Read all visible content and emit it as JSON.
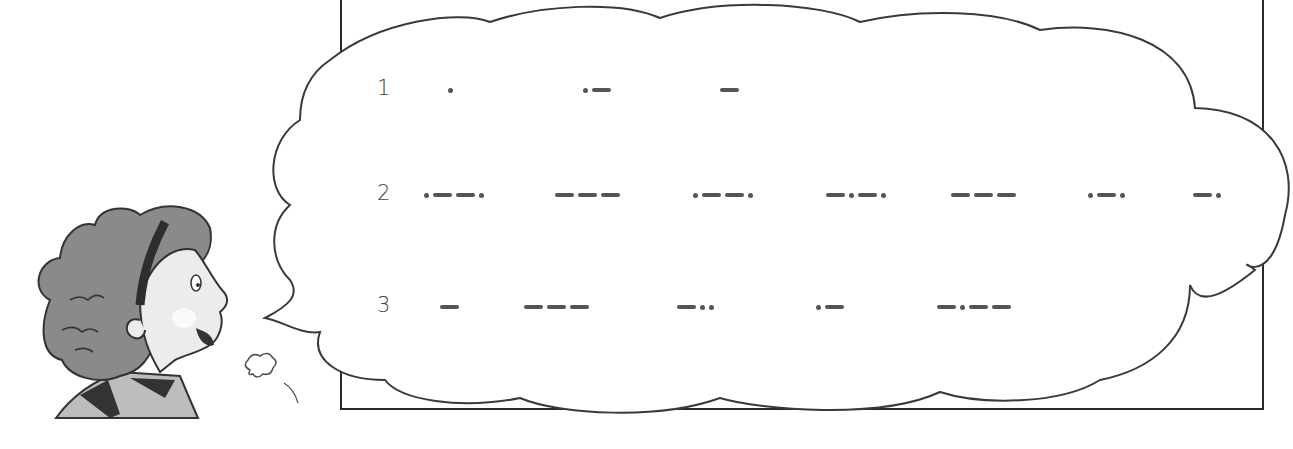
{
  "illustration": {
    "description": "Girl with curly hair and headband speaking in a cloud-shaped speech bubble containing Morse code",
    "colors": {
      "outline": "#333333",
      "hair": "#8a8a8a",
      "headband": "#2e2e2e",
      "skin": "#ebebeb",
      "shirt": "#bdbdbd"
    }
  },
  "morse_rows": [
    {
      "number": "1",
      "letters": [
        ".",
        ".-",
        "-"
      ],
      "x": [
        448,
        583,
        720
      ]
    },
    {
      "number": "2",
      "letters": [
        ".--.",
        "---",
        ".--.",
        "-.-.",
        "---",
        ".-.",
        "-."
      ],
      "x": [
        424,
        555,
        693,
        826,
        951,
        1088,
        1193
      ]
    },
    {
      "number": "3",
      "letters": [
        "-",
        "---",
        "-..",
        ".-",
        "-.--"
      ],
      "x": [
        440,
        524,
        677,
        816,
        937
      ]
    }
  ],
  "row_y": [
    88,
    193,
    305
  ],
  "number_x": 377
}
